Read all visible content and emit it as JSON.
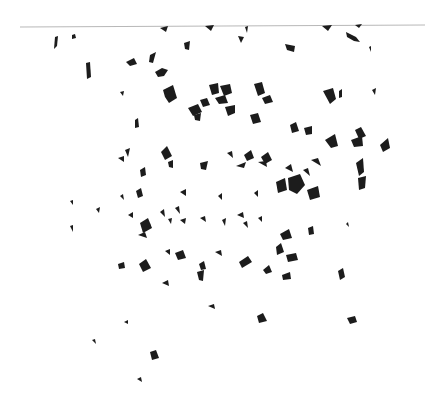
{
  "image": {
    "width": 434,
    "height": 402,
    "background": "#ffffff",
    "fragment_color": "#1c1c1c",
    "horizon_line": {
      "x1": 20,
      "y1": 27,
      "x2": 425,
      "y2": 25,
      "color": "#b8b8b8",
      "width": 1.2
    }
  },
  "fragments": [
    [
      55,
      37,
      58,
      36,
      57,
      46,
      54,
      49
    ],
    [
      72,
      35,
      75,
      34,
      76,
      38,
      72,
      39
    ],
    [
      86,
      63,
      90,
      62,
      91,
      77,
      87,
      79
    ],
    [
      160,
      28,
      168,
      26,
      166,
      32
    ],
    [
      205,
      26,
      214,
      25,
      211,
      31
    ],
    [
      245,
      27,
      248,
      26,
      247,
      33
    ],
    [
      322,
      26,
      332,
      25,
      328,
      31
    ],
    [
      346,
      32,
      356,
      37,
      360,
      42,
      354,
      41,
      347,
      37
    ],
    [
      355,
      25,
      362,
      24,
      359,
      28
    ],
    [
      126,
      62,
      134,
      58,
      137,
      64,
      130,
      66
    ],
    [
      150,
      55,
      156,
      52,
      153,
      63,
      149,
      62
    ],
    [
      155,
      72,
      162,
      68,
      168,
      70,
      164,
      76,
      158,
      77
    ],
    [
      184,
      43,
      190,
      41,
      189,
      50,
      185,
      49
    ],
    [
      238,
      36,
      244,
      37,
      241,
      43
    ],
    [
      285,
      44,
      295,
      46,
      294,
      52,
      287,
      50
    ],
    [
      369,
      47,
      371,
      46,
      371,
      52
    ],
    [
      163,
      90,
      173,
      85,
      177,
      98,
      169,
      103,
      165,
      97
    ],
    [
      209,
      85,
      218,
      83,
      219,
      93,
      212,
      95
    ],
    [
      220,
      86,
      230,
      84,
      232,
      93,
      224,
      96
    ],
    [
      215,
      98,
      225,
      95,
      228,
      103,
      219,
      104
    ],
    [
      200,
      100,
      207,
      98,
      210,
      105,
      203,
      107
    ],
    [
      254,
      84,
      262,
      82,
      265,
      93,
      258,
      96
    ],
    [
      262,
      98,
      270,
      95,
      273,
      102,
      265,
      104
    ],
    [
      323,
      91,
      333,
      88,
      336,
      99,
      330,
      104
    ],
    [
      339,
      91,
      342,
      89,
      342,
      97,
      339,
      98
    ],
    [
      372,
      90,
      376,
      88,
      375,
      95
    ],
    [
      120,
      92,
      124,
      91,
      123,
      96
    ],
    [
      135,
      120,
      138,
      118,
      139,
      127,
      135,
      128
    ],
    [
      188,
      108,
      198,
      104,
      202,
      112,
      193,
      116
    ],
    [
      194,
      115,
      201,
      113,
      200,
      121,
      195,
      120
    ],
    [
      225,
      107,
      235,
      105,
      235,
      113,
      228,
      116
    ],
    [
      250,
      115,
      258,
      113,
      261,
      122,
      253,
      124
    ],
    [
      290,
      125,
      296,
      122,
      299,
      131,
      292,
      133
    ],
    [
      304,
      128,
      312,
      126,
      312,
      134,
      306,
      135
    ],
    [
      325,
      140,
      335,
      134,
      338,
      146,
      331,
      148
    ],
    [
      355,
      130,
      361,
      127,
      366,
      136,
      359,
      139
    ],
    [
      351,
      140,
      362,
      136,
      363,
      146,
      354,
      147
    ],
    [
      380,
      145,
      388,
      138,
      390,
      148,
      383,
      152
    ],
    [
      125,
      150,
      130,
      148,
      128,
      157
    ],
    [
      161,
      152,
      167,
      146,
      172,
      156,
      165,
      160
    ],
    [
      168,
      162,
      173,
      160,
      173,
      168,
      169,
      167
    ],
    [
      118,
      158,
      124,
      156,
      124,
      162
    ],
    [
      140,
      170,
      145,
      167,
      146,
      175,
      141,
      177
    ],
    [
      200,
      163,
      208,
      161,
      206,
      170,
      201,
      169
    ],
    [
      227,
      153,
      232,
      151,
      233,
      158
    ],
    [
      244,
      155,
      251,
      150,
      254,
      158,
      247,
      161
    ],
    [
      261,
      157,
      268,
      152,
      272,
      160,
      265,
      164
    ],
    [
      258,
      162,
      266,
      161,
      267,
      167
    ],
    [
      285,
      168,
      291,
      164,
      293,
      172
    ],
    [
      288,
      178,
      300,
      174,
      305,
      185,
      297,
      194,
      289,
      190
    ],
    [
      303,
      170,
      308,
      168,
      310,
      176
    ],
    [
      311,
      160,
      318,
      158,
      321,
      166
    ],
    [
      356,
      163,
      363,
      158,
      364,
      172,
      359,
      176
    ],
    [
      358,
      178,
      366,
      176,
      365,
      188,
      359,
      190
    ],
    [
      236,
      166,
      246,
      162,
      244,
      168
    ],
    [
      276,
      182,
      285,
      178,
      287,
      190,
      278,
      193
    ],
    [
      307,
      190,
      318,
      186,
      320,
      197,
      310,
      200
    ],
    [
      218,
      196,
      222,
      193,
      222,
      200
    ],
    [
      254,
      193,
      258,
      190,
      258,
      197
    ],
    [
      180,
      192,
      186,
      189,
      186,
      196
    ],
    [
      70,
      201,
      73,
      200,
      73,
      205
    ],
    [
      96,
      209,
      100,
      207,
      99,
      213
    ],
    [
      120,
      196,
      123,
      194,
      124,
      200
    ],
    [
      136,
      191,
      141,
      188,
      143,
      196,
      138,
      198
    ],
    [
      160,
      212,
      164,
      209,
      165,
      217
    ],
    [
      175,
      208,
      179,
      206,
      180,
      214
    ],
    [
      128,
      215,
      133,
      212,
      133,
      218
    ],
    [
      140,
      223,
      148,
      218,
      152,
      228,
      143,
      233
    ],
    [
      138,
      235,
      145,
      232,
      147,
      238
    ],
    [
      146,
      226,
      150,
      223,
      151,
      228
    ],
    [
      168,
      219,
      172,
      218,
      171,
      224
    ],
    [
      180,
      220,
      186,
      218,
      185,
      224
    ],
    [
      200,
      218,
      205,
      216,
      206,
      222
    ],
    [
      222,
      220,
      226,
      218,
      225,
      226
    ],
    [
      237,
      215,
      243,
      212,
      244,
      218
    ],
    [
      243,
      223,
      247,
      221,
      248,
      228
    ],
    [
      258,
      218,
      262,
      216,
      262,
      222
    ],
    [
      280,
      234,
      289,
      229,
      292,
      238,
      283,
      240
    ],
    [
      276,
      247,
      281,
      243,
      284,
      252,
      277,
      255
    ],
    [
      286,
      255,
      296,
      253,
      298,
      260,
      288,
      262
    ],
    [
      308,
      228,
      313,
      226,
      314,
      234,
      309,
      235
    ],
    [
      346,
      224,
      348,
      222,
      349,
      227
    ],
    [
      70,
      226,
      73,
      225,
      73,
      232
    ],
    [
      118,
      264,
      124,
      262,
      125,
      268,
      119,
      269
    ],
    [
      139,
      264,
      146,
      259,
      151,
      268,
      143,
      272
    ],
    [
      165,
      251,
      170,
      249,
      170,
      255
    ],
    [
      175,
      253,
      183,
      250,
      186,
      258,
      178,
      260
    ],
    [
      199,
      264,
      204,
      261,
      206,
      269,
      201,
      270
    ],
    [
      197,
      272,
      204,
      270,
      203,
      281,
      199,
      280
    ],
    [
      215,
      252,
      221,
      250,
      222,
      256
    ],
    [
      239,
      262,
      248,
      256,
      252,
      262,
      242,
      268
    ],
    [
      263,
      270,
      269,
      265,
      272,
      272,
      266,
      274
    ],
    [
      282,
      275,
      290,
      272,
      291,
      279,
      283,
      280
    ],
    [
      338,
      271,
      343,
      268,
      345,
      277,
      340,
      280
    ],
    [
      162,
      283,
      168,
      280,
      169,
      286
    ],
    [
      208,
      306,
      214,
      304,
      215,
      309
    ],
    [
      257,
      316,
      263,
      313,
      267,
      321,
      259,
      323
    ],
    [
      347,
      318,
      355,
      316,
      357,
      322,
      350,
      324
    ],
    [
      124,
      322,
      128,
      320,
      128,
      324
    ],
    [
      92,
      340,
      95,
      339,
      96,
      344
    ],
    [
      150,
      352,
      156,
      350,
      159,
      358,
      152,
      360
    ],
    [
      137,
      379,
      141,
      377,
      142,
      382
    ]
  ]
}
